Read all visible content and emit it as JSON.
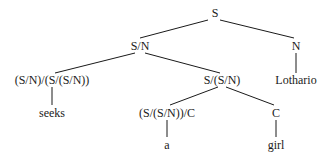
{
  "diagram": {
    "type": "parse-tree",
    "nodes": {
      "root": {
        "label": "S",
        "x": 215,
        "y": 13
      },
      "s_n": {
        "label": "S/N",
        "x": 140,
        "y": 46
      },
      "n": {
        "label": "N",
        "x": 296,
        "y": 46
      },
      "seeks_cat": {
        "label": "(S/N)/(S/(S/N))",
        "x": 52,
        "y": 80
      },
      "np_cat": {
        "label": "S/(S/N)",
        "x": 222,
        "y": 80
      },
      "lothario": {
        "label": "Lothario",
        "x": 296,
        "y": 80
      },
      "seeks": {
        "label": "seeks",
        "x": 52,
        "y": 113
      },
      "det_cat": {
        "label": "(S/(S/N))/C",
        "x": 167,
        "y": 113
      },
      "c": {
        "label": "C",
        "x": 276,
        "y": 113
      },
      "a": {
        "label": "a",
        "x": 167,
        "y": 145
      },
      "girl": {
        "label": "girl",
        "x": 276,
        "y": 145
      }
    },
    "edges": [
      {
        "from": "root",
        "to": "s_n",
        "x1": 208,
        "y1": 20,
        "x2": 140,
        "y2": 38
      },
      {
        "from": "root",
        "to": "n",
        "x1": 220,
        "y1": 20,
        "x2": 294,
        "y2": 38
      },
      {
        "from": "s_n",
        "to": "seeks_cat",
        "x1": 135,
        "y1": 53,
        "x2": 55,
        "y2": 73
      },
      {
        "from": "s_n",
        "to": "np_cat",
        "x1": 145,
        "y1": 53,
        "x2": 220,
        "y2": 73
      },
      {
        "from": "n",
        "to": "lothario",
        "x1": 296,
        "y1": 53,
        "x2": 296,
        "y2": 73
      },
      {
        "from": "seeks_cat",
        "to": "seeks",
        "x1": 52,
        "y1": 87,
        "x2": 52,
        "y2": 105
      },
      {
        "from": "np_cat",
        "to": "det_cat",
        "x1": 218,
        "y1": 87,
        "x2": 170,
        "y2": 105
      },
      {
        "from": "np_cat",
        "to": "c",
        "x1": 226,
        "y1": 87,
        "x2": 274,
        "y2": 105
      },
      {
        "from": "det_cat",
        "to": "a",
        "x1": 167,
        "y1": 120,
        "x2": 167,
        "y2": 137
      },
      {
        "from": "c",
        "to": "girl",
        "x1": 276,
        "y1": 120,
        "x2": 276,
        "y2": 137
      }
    ],
    "line_color": "#1a1a1a",
    "text_color": "#1a1a1a"
  }
}
